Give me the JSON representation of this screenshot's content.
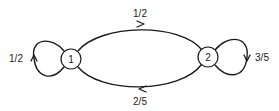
{
  "diagram": {
    "type": "markov-chain-state-diagram",
    "nodes": [
      {
        "id": "1",
        "label": "1"
      },
      {
        "id": "2",
        "label": "2"
      }
    ],
    "edges": [
      {
        "from": "1",
        "to": "1",
        "label": "1/2",
        "kind": "self-loop"
      },
      {
        "from": "1",
        "to": "2",
        "label": "1/2",
        "kind": "top-arc"
      },
      {
        "from": "2",
        "to": "2",
        "label": "3/5",
        "kind": "self-loop"
      },
      {
        "from": "2",
        "to": "1",
        "label": "2/5",
        "kind": "bottom-arc"
      }
    ],
    "colors": {
      "stroke": "#1a1a1a",
      "background": "#ffffff"
    }
  }
}
